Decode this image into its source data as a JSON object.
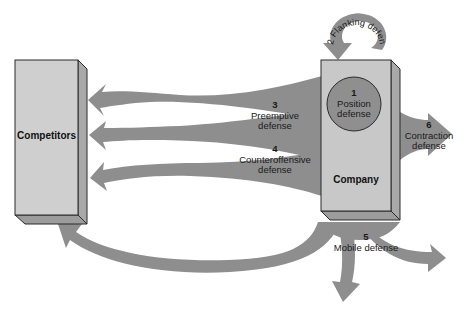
{
  "diagram": {
    "colors": {
      "arrow": "#8e8e8e",
      "box_front": "#cfcfcf",
      "box_side": "#a9a9a9",
      "box_bottom": "#9c9c9c",
      "box_outline": "#2a2a2a",
      "circle_fill": "#8f8f8f",
      "text": "#1a1a1a",
      "background": "#ffffff"
    },
    "entities": {
      "competitors": {
        "label": "Competitors"
      },
      "company": {
        "label": "Company"
      }
    },
    "strategies": [
      {
        "number": "1",
        "name": "Position defense",
        "line1": "Position",
        "line2": "defense"
      },
      {
        "number": "2",
        "name": "Flanking defense",
        "label": "2 Flanking defense"
      },
      {
        "number": "3",
        "name": "Preemptive defense",
        "line1": "Preemptive",
        "line2": "defense"
      },
      {
        "number": "4",
        "name": "Counteroffensive defense",
        "line1": "Counteroffensive",
        "line2": "defense"
      },
      {
        "number": "5",
        "name": "Mobile defense",
        "line1": "Mobile defense"
      },
      {
        "number": "6",
        "name": "Contraction defense",
        "line1": "Contraction",
        "line2": "defense"
      }
    ]
  }
}
